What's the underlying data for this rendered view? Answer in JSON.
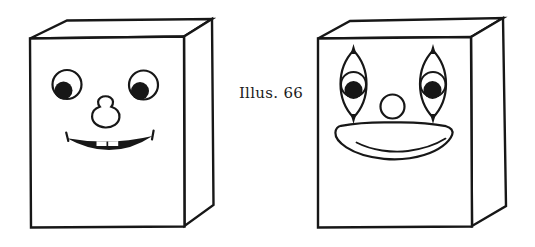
{
  "canvas": {
    "background": "#ffffff",
    "ink": "#171717",
    "paper": "#ffffff"
  },
  "caption": {
    "label": "Illus. 66"
  },
  "figures": {
    "left_box": {
      "name": "box-with-simple-smiling-face"
    },
    "right_box": {
      "name": "box-with-clown-face"
    }
  }
}
